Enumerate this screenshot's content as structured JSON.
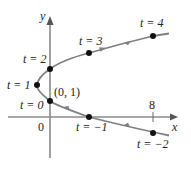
{
  "figure": {
    "type": "parametric-curve",
    "axes": {
      "x_label": "x",
      "y_label": "y",
      "origin_label": "0",
      "x_tick_label": "8"
    },
    "special_point_label": "(0, 1)",
    "points": [
      {
        "t": -2,
        "label": "t = −2",
        "x": 8,
        "y": -1
      },
      {
        "t": -1,
        "label": "t = −1",
        "x": 3,
        "y": 0
      },
      {
        "t": 0,
        "label": "t = 0",
        "x": 0,
        "y": 1
      },
      {
        "t": 1,
        "label": "t = 1",
        "x": -1,
        "y": 2
      },
      {
        "t": 2,
        "label": "t = 2",
        "x": 0,
        "y": 3
      },
      {
        "t": 3,
        "label": "t = 3",
        "x": 3,
        "y": 4
      },
      {
        "t": 4,
        "label": "t = 4",
        "x": 8,
        "y": 5
      }
    ],
    "equation_hint": "x = t^2 - 2t, y = t + 1",
    "colors": {
      "curve": "#808080",
      "axes": "#8a8a8a",
      "points": "#111111",
      "text": "#222222"
    }
  }
}
